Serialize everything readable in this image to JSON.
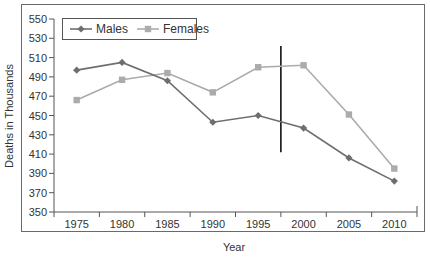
{
  "chart_data": {
    "type": "line",
    "title": "",
    "xlabel": "Year",
    "ylabel": "Deaths in Thousands",
    "categories": [
      "1975",
      "1980",
      "1985",
      "1990",
      "1995",
      "2000",
      "2005",
      "2010"
    ],
    "series": [
      {
        "name": "Males",
        "marker": "diamond",
        "color": "#6e6e6e",
        "values": [
          497,
          505,
          486,
          443,
          450,
          437,
          406,
          382
        ]
      },
      {
        "name": "Females",
        "marker": "square",
        "color": "#ababab",
        "values": [
          466,
          487,
          494,
          474,
          500,
          502,
          451,
          395
        ]
      }
    ],
    "ylim": [
      350,
      550
    ],
    "yticks": [
      350,
      370,
      390,
      410,
      430,
      450,
      470,
      490,
      510,
      530,
      550
    ],
    "grid": false,
    "legend_position": "top-left inside",
    "annotations": [
      {
        "type": "vertical-line",
        "x_between": [
          "1995",
          "2000"
        ],
        "y_from": 412,
        "y_to": 522,
        "color": "#111111"
      }
    ]
  }
}
